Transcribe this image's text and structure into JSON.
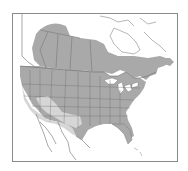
{
  "map": {
    "type": "range-map",
    "region": "North America",
    "colors": {
      "background": "#ffffff",
      "land_unshaded": "#ffffff",
      "range_primary": "#a9a9a9",
      "range_secondary": "#d6d6d6",
      "borders": "#6e6e6e",
      "frame": "#8a8a8a"
    },
    "legend": []
  }
}
